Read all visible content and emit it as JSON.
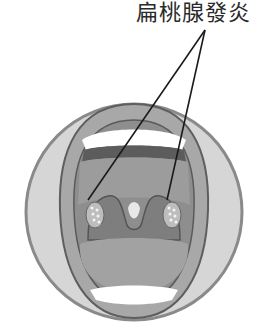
{
  "illustration": {
    "subject": "open-mouth-throat",
    "label": "扁桃腺發炎",
    "colors": {
      "outer_circle": "#d9d9d9",
      "outer_circle_stroke": "#8c8c8c",
      "lips": "#a6a6a6",
      "lips_stroke": "#5f5f5f",
      "palate": "#9a9a9a",
      "throat": "#8a8a8a",
      "tongue": "#a3a3a3",
      "teeth": "#ffffff",
      "gum": "#5a5a5a",
      "tonsil": "#b8b8b8",
      "pus_spots": "#f2f2f2",
      "pointer_line": "#1a1a1a"
    }
  }
}
